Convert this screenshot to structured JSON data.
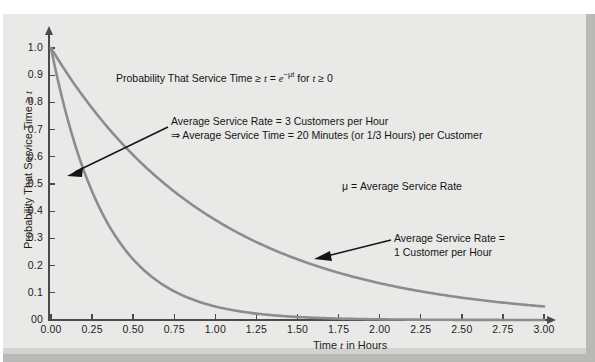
{
  "chart_data": {
    "type": "line",
    "title": "",
    "xlabel": "Time t in Hours",
    "ylabel": "Probability That Service Time ≥ t",
    "xlim": [
      0.0,
      3.0
    ],
    "ylim": [
      0.0,
      1.0
    ],
    "grid": false,
    "legend_position": "none",
    "x_ticks": [
      "0.00",
      "0.25",
      "0.50",
      "0.75",
      "1.00",
      "1.25",
      "1.50",
      "1.75",
      "2.00",
      "2.25",
      "2.50",
      "2.75",
      "3.00"
    ],
    "y_ticks": [
      "00",
      "0.1",
      "0.2",
      "0.3",
      "0.4",
      "0.5",
      "0.6",
      "0.7",
      "0.8",
      "0.9",
      "1.0"
    ],
    "x_tick_values": [
      0.0,
      0.25,
      0.5,
      0.75,
      1.0,
      1.25,
      1.5,
      1.75,
      2.0,
      2.25,
      2.5,
      2.75,
      3.0
    ],
    "y_tick_values": [
      0.0,
      0.1,
      0.2,
      0.3,
      0.4,
      0.5,
      0.6,
      0.7,
      0.8,
      0.9,
      1.0
    ],
    "series": [
      {
        "name": "Average Service Rate = 3 Customers per Hour",
        "mu": 3,
        "color": "#8c8c8c",
        "x": [
          0.0,
          0.25,
          0.5,
          0.75,
          1.0,
          1.25,
          1.5,
          1.75,
          2.0,
          2.25,
          2.5,
          2.75,
          3.0
        ],
        "values": [
          1.0,
          0.472,
          0.223,
          0.105,
          0.05,
          0.024,
          0.011,
          0.005,
          0.002,
          0.001,
          0.001,
          0.0,
          0.0
        ]
      },
      {
        "name": "Average Service Rate = 1 Customer per Hour",
        "mu": 1,
        "color": "#8c8c8c",
        "x": [
          0.0,
          0.25,
          0.5,
          0.75,
          1.0,
          1.25,
          1.5,
          1.75,
          2.0,
          2.25,
          2.5,
          2.75,
          3.0
        ],
        "values": [
          1.0,
          0.779,
          0.607,
          0.472,
          0.368,
          0.287,
          0.223,
          0.174,
          0.135,
          0.105,
          0.082,
          0.064,
          0.05
        ]
      }
    ],
    "annotations": [
      {
        "name": "formula",
        "text": "Probability That Service Time ≥ t = e⁻ᵘᵗ  for t ≥ 0"
      },
      {
        "name": "rate-3-callout",
        "line1": "Average Service Rate = 3 Customers per Hour",
        "line2": "⇒ Average Service Time = 20 Minutes (or 1/3 Hours) per Customer"
      },
      {
        "name": "mu-definition",
        "text": "μ = Average Service Rate"
      },
      {
        "name": "rate-1-callout",
        "line1": "Average Service Rate =",
        "line2": "1 Customer per Hour"
      }
    ]
  },
  "axes": {
    "x_title_prefix": "Time ",
    "x_title_var": "t",
    "x_title_suffix": " in Hours",
    "y_title_prefix": "Probability That Service Time ≥ ",
    "y_title_var": "t"
  },
  "formula": {
    "prefix": "Probability That Service Time ≥ ",
    "var_t": "t",
    "equals": " = ",
    "base": "e",
    "exponent": "−μt",
    "condition_prefix": "  for ",
    "condition_var": "t",
    "condition_suffix": " ≥ 0"
  },
  "notes": {
    "rate3_line1": "Average Service Rate = 3 Customers per Hour",
    "rate3_line2": "⇒ Average Service Time = 20 Minutes (or 1/3 Hours) per Customer",
    "mu_definition": "μ = Average Service Rate",
    "rate1_line1": "Average Service Rate =",
    "rate1_line2": "1 Customer per Hour"
  },
  "colors": {
    "curve": "#8c8c8c",
    "axis": "#4a4a4a",
    "background": "#e9e9e7",
    "text": "#151515"
  }
}
